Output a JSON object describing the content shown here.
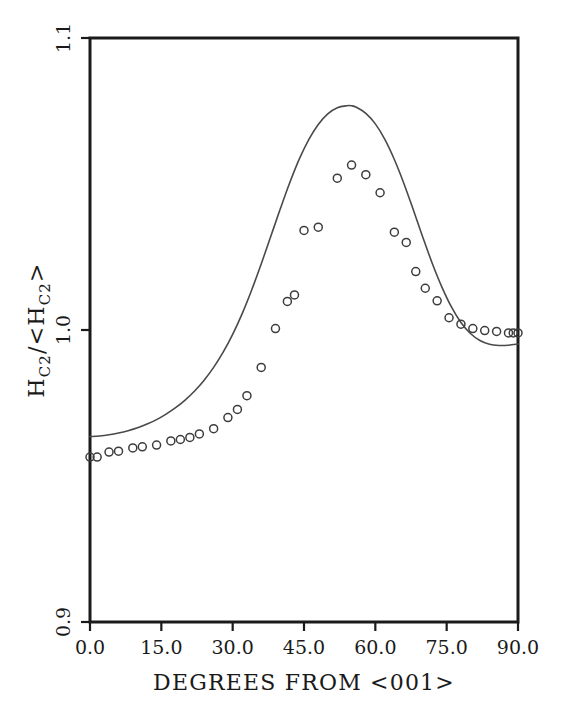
{
  "chart_data": {
    "type": "line",
    "title": "",
    "subtitle": "",
    "xlabel": "DEGREES FROM <001>",
    "ylabel": "H_C2/<H_C2>",
    "ylabel_parts": {
      "main1": "H",
      "sub1": "C2",
      "slash": "/",
      "bracket_open": "<",
      "main2": "H",
      "sub2": "C2",
      "bracket_close": ">"
    },
    "xlim": [
      0.0,
      90.0
    ],
    "ylim": [
      0.9,
      1.1
    ],
    "xticks": [
      0.0,
      15.0,
      30.0,
      45.0,
      60.0,
      75.0,
      90.0
    ],
    "xticklabels": [
      "0.0",
      "15.0",
      "30.0",
      "45.0",
      "60.0",
      "75.0",
      "90.0"
    ],
    "yticks": [
      0.9,
      1.0,
      1.1
    ],
    "yticklabels": [
      "0.9",
      "1.0",
      "1.1"
    ],
    "grid": false,
    "legend": "none",
    "series": [
      {
        "name": "theory",
        "type": "line",
        "style": "solid",
        "color": "#4a4a4a",
        "x": [
          0.0,
          2.0,
          4.0,
          6.0,
          8.0,
          10.0,
          12.0,
          14.0,
          16.0,
          18.0,
          20.0,
          22.0,
          24.0,
          26.0,
          28.0,
          30.0,
          32.0,
          34.0,
          36.0,
          38.0,
          40.0,
          42.0,
          44.0,
          46.0,
          48.0,
          50.0,
          52.0,
          54.0,
          55.0,
          56.0,
          58.0,
          60.0,
          62.0,
          64.0,
          66.0,
          68.0,
          70.0,
          72.0,
          74.0,
          76.0,
          78.0,
          80.0,
          82.0,
          84.0,
          86.0,
          88.0,
          90.0
        ],
        "y": [
          0.9635,
          0.9637,
          0.9641,
          0.9647,
          0.9655,
          0.9665,
          0.9678,
          0.9693,
          0.9712,
          0.9734,
          0.976,
          0.9791,
          0.9828,
          0.9872,
          0.9924,
          0.9985,
          1.0056,
          1.0137,
          1.0226,
          1.032,
          1.0414,
          1.0504,
          1.0585,
          1.0652,
          1.0704,
          1.074,
          1.0761,
          1.0768,
          1.0768,
          1.0763,
          1.0742,
          1.0706,
          1.0653,
          1.0584,
          1.0502,
          1.0411,
          1.0317,
          1.0227,
          1.0147,
          1.0079,
          1.0026,
          0.9988,
          0.9964,
          0.9951,
          0.9947,
          0.9948,
          0.9952
        ]
      },
      {
        "name": "measured",
        "type": "scatter",
        "marker": "open-circle",
        "color": "#3d3d3d",
        "x": [
          0.0,
          1.5,
          4.0,
          6.0,
          9.0,
          11.0,
          14.0,
          17.0,
          19.0,
          21.0,
          23.0,
          26.0,
          29.0,
          31.0,
          33.0,
          36.0,
          39.0,
          41.5,
          43.0,
          45.0,
          48.0,
          52.0,
          55.0,
          58.0,
          61.0,
          64.0,
          66.5,
          68.5,
          70.5,
          73.0,
          75.5,
          78.0,
          80.5,
          83.0,
          85.5,
          88.0,
          89.0,
          90.0
        ],
        "y": [
          0.9565,
          0.9565,
          0.9582,
          0.9585,
          0.9596,
          0.96,
          0.9606,
          0.962,
          0.9625,
          0.9632,
          0.9644,
          0.9662,
          0.97,
          0.9728,
          0.9775,
          0.9872,
          1.0005,
          1.0098,
          1.012,
          1.0341,
          1.0352,
          1.052,
          1.0565,
          1.0532,
          1.047,
          1.0335,
          1.03,
          1.02,
          1.0143,
          1.01,
          1.0042,
          1.002,
          1.0005,
          0.9998,
          0.9995,
          0.999,
          0.999,
          0.999
        ]
      }
    ]
  }
}
